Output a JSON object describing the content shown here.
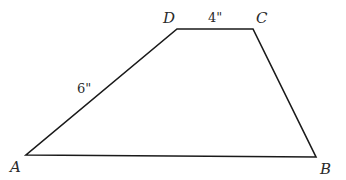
{
  "diagram": {
    "type": "trapezoid",
    "stroke_color": "#1a1a1a",
    "vertices": [
      {
        "name": "A",
        "x": 26,
        "y": 155,
        "label_x": 10,
        "label_y": 172
      },
      {
        "name": "B",
        "x": 316,
        "y": 157,
        "label_x": 320,
        "label_y": 174
      },
      {
        "name": "C",
        "x": 253,
        "y": 29,
        "label_x": 256,
        "label_y": 23
      },
      {
        "name": "D",
        "x": 177,
        "y": 29,
        "label_x": 163,
        "label_y": 23
      }
    ],
    "measurements": [
      {
        "side": "DC",
        "text": "4\"",
        "x": 208,
        "y": 22
      },
      {
        "side": "AD",
        "text": "6\"",
        "x": 77,
        "y": 93
      }
    ]
  }
}
